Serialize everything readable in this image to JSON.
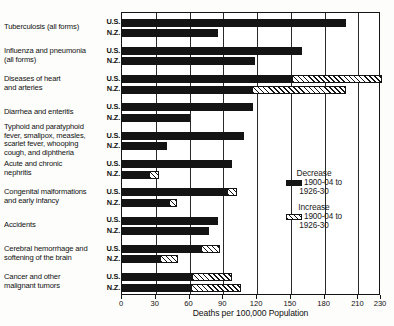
{
  "chart_data": {
    "type": "bar",
    "orientation": "horizontal",
    "title": "",
    "xlabel": "Deaths per 100,000 Population",
    "ylabel": "",
    "xlim": [
      0,
      230
    ],
    "xticks": [
      0,
      30,
      60,
      90,
      120,
      150,
      180,
      210,
      230
    ],
    "xtick_labels": [
      "0",
      "30",
      "60",
      "90",
      "120",
      "150",
      "180",
      "210",
      "230"
    ],
    "grid": true,
    "legend_position": "right-middle",
    "series": [
      {
        "name": "Decrease 1900-04 to 1926-30",
        "key": "decrease",
        "fill": "solid-black",
        "color": "#141414"
      },
      {
        "name": "Increase 1900-04 to 1926-30",
        "key": "increase",
        "fill": "hatched",
        "color": "#141414"
      }
    ],
    "categories": [
      "Tuberculosis (all forms)",
      "Influenza and pneumonia (all forms)",
      "Diseases of heart and arteries",
      "Diarrhea and enteritis",
      "Typhoid and paratyphoid fever, smallpox, measles, scarlet fever, whooping cough, and diphtheria",
      "Acute and chronic nephritis",
      "Congenital malformations and early infancy",
      "Accidents",
      "Cerebral hemorrhage and softening of the brain",
      "Cancer and other malignant tumors"
    ],
    "rows": [
      {
        "category": "Tuberculosis (all forms)",
        "country": "U.S.",
        "decrease": 200,
        "increase": 0,
        "total": 200
      },
      {
        "category": "Tuberculosis (all forms)",
        "country": "N.Z.",
        "decrease": 86,
        "increase": 0,
        "total": 86
      },
      {
        "category": "Influenza and pneumonia (all forms)",
        "country": "U.S.",
        "decrease": 161,
        "increase": 0,
        "total": 161
      },
      {
        "category": "Influenza and pneumonia (all forms)",
        "country": "N.Z.",
        "decrease": 119,
        "increase": 0,
        "total": 119
      },
      {
        "category": "Diseases of heart and arteries",
        "country": "U.S.",
        "decrease": 152,
        "increase": 80,
        "total": 232
      },
      {
        "category": "Diseases of heart and arteries",
        "country": "N.Z.",
        "decrease": 116,
        "increase": 84,
        "total": 200
      },
      {
        "category": "Diarrhea and enteritis",
        "country": "U.S.",
        "decrease": 117,
        "increase": 0,
        "total": 117
      },
      {
        "category": "Diarrhea and enteritis",
        "country": "N.Z.",
        "decrease": 61,
        "increase": 0,
        "total": 61
      },
      {
        "category": "Typhoid and paratyphoid fever, smallpox, measles, scarlet fever, whooping cough, and diphtheria",
        "country": "U.S.",
        "decrease": 109,
        "increase": 0,
        "total": 109
      },
      {
        "category": "Typhoid and paratyphoid fever, smallpox, measles, scarlet fever, whooping cough, and diphtheria",
        "country": "N.Z.",
        "decrease": 41,
        "increase": 0,
        "total": 41
      },
      {
        "category": "Acute and chronic nephritis",
        "country": "U.S.",
        "decrease": 99,
        "increase": 0,
        "total": 99
      },
      {
        "category": "Acute and chronic nephritis",
        "country": "N.Z.",
        "decrease": 25,
        "increase": 9,
        "total": 34
      },
      {
        "category": "Congenital malformations and early infancy",
        "country": "U.S.",
        "decrease": 94,
        "increase": 9,
        "total": 103
      },
      {
        "category": "Congenital malformations and early infancy",
        "country": "N.Z.",
        "decrease": 43,
        "increase": 7,
        "total": 50
      },
      {
        "category": "Accidents",
        "country": "U.S.",
        "decrease": 86,
        "increase": 0,
        "total": 86
      },
      {
        "category": "Accidents",
        "country": "N.Z.",
        "decrease": 78,
        "increase": 0,
        "total": 78
      },
      {
        "category": "Cerebral hemorrhage and softening of the brain",
        "country": "U.S.",
        "decrease": 71,
        "increase": 17,
        "total": 88
      },
      {
        "category": "Cerebral hemorrhage and softening of the brain",
        "country": "N.Z.",
        "decrease": 35,
        "increase": 16,
        "total": 51
      },
      {
        "category": "Cancer and other malignant tumors",
        "country": "U.S.",
        "decrease": 63,
        "increase": 36,
        "total": 99
      },
      {
        "category": "Cancer and other malignant tumors",
        "country": "N.Z.",
        "decrease": 62,
        "increase": 45,
        "total": 107
      }
    ]
  },
  "axis": {
    "title": "Deaths per 100,000 Population",
    "ticks": [
      {
        "value": 0,
        "label": "0"
      },
      {
        "value": 30,
        "label": "30"
      },
      {
        "value": 60,
        "label": "60"
      },
      {
        "value": 90,
        "label": "90"
      },
      {
        "value": 120,
        "label": "120"
      },
      {
        "value": 150,
        "label": "150"
      },
      {
        "value": 180,
        "label": "180"
      },
      {
        "value": 210,
        "label": "210"
      },
      {
        "value": 230,
        "label": "230"
      }
    ]
  },
  "categories": [
    {
      "id": "tuberculosis",
      "lines": [
        "Tuberculosis (all forms)"
      ]
    },
    {
      "id": "influenza-pneumonia",
      "lines": [
        "Influenza and pneumonia",
        "(all forms)"
      ]
    },
    {
      "id": "heart-arteries",
      "lines": [
        "Diseases of  heart",
        "and arteries"
      ]
    },
    {
      "id": "diarrhea-enteritis",
      "lines": [
        "Diarrhea and enteritis"
      ]
    },
    {
      "id": "typhoid-group",
      "lines": [
        "Typhoid and paratyphoid",
        "fever, smallpox, measles,",
        "scarlet fever, whooping",
        "cough, and diphtheria"
      ]
    },
    {
      "id": "nephritis",
      "lines": [
        "Acute  and  chronic",
        "nephritis"
      ]
    },
    {
      "id": "congenital",
      "lines": [
        "Congenital malformations",
        "and early infancy"
      ]
    },
    {
      "id": "accidents",
      "lines": [
        "Accidents"
      ]
    },
    {
      "id": "cerebral-hemorrhage",
      "lines": [
        "Cerebral hemorrhage and",
        "softening of the brain"
      ]
    },
    {
      "id": "cancer",
      "lines": [
        "Cancer and other",
        "malignant tumors"
      ]
    }
  ],
  "country_labels": {
    "us": "U.S.",
    "nz": "N.Z."
  },
  "legend": {
    "decrease": {
      "head": "Decrease",
      "line1": "1900-04 to",
      "line2": "1926-30"
    },
    "increase": {
      "head": "Increase",
      "line1": "1900-04 to",
      "line2": "1926-30"
    }
  },
  "colors": {
    "ink": "#141414",
    "paper": "#ffffff"
  }
}
